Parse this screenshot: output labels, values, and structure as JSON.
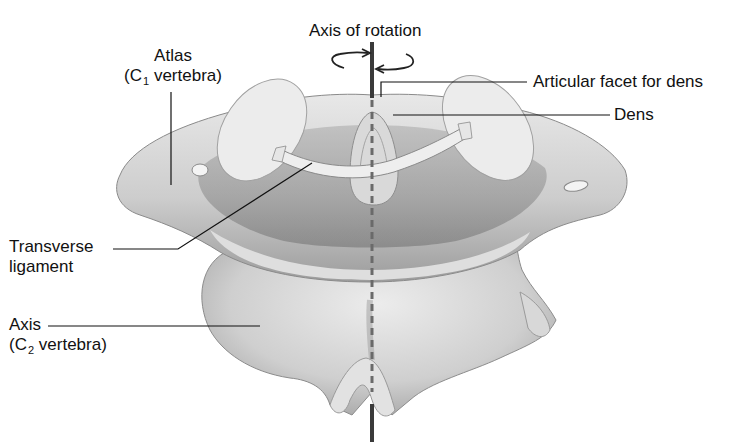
{
  "figure": {
    "type": "anatomical-illustration",
    "colors": {
      "background": "#ffffff",
      "bone_light": "#e6e6e6",
      "bone_mid": "#c4c4c4",
      "bone_dark": "#8a8a8a",
      "axis_line": "#3a3a3a",
      "leader_line": "#111111"
    }
  },
  "labels": {
    "axis_of_rotation": "Axis of rotation",
    "atlas_name": "Atlas",
    "atlas_paren_open": "(C",
    "atlas_sub": "1",
    "atlas_rest": " vertebra)",
    "articular_facet": "Articular facet for dens",
    "dens": "Dens",
    "transverse_1": "Transverse",
    "transverse_2": "ligament",
    "axis_name": "Axis",
    "axis_paren_open": "(C",
    "axis_sub": "2",
    "axis_rest": " vertebra)"
  },
  "icons": {
    "rotation_left": "curved-arrow-right",
    "rotation_right": "curved-arrow-left"
  }
}
